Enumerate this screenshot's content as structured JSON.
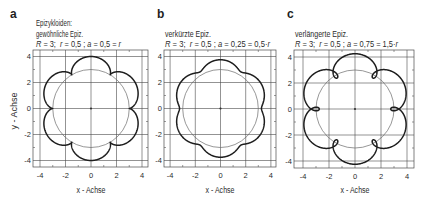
{
  "figure": {
    "y_axis_label": "y - Achse",
    "panels": [
      {
        "label": "a",
        "title_lines": [
          "Epizykloiden:",
          "gewöhnliche Epiz."
        ],
        "params_line": [
          "R",
          " = 3;  ",
          "r",
          " = 0,5 ; ",
          "a",
          " = 0,5 = ",
          "r"
        ],
        "x_axis_label": "x - Achse"
      },
      {
        "label": "b",
        "title_lines": [
          "verkürzte Epiz."
        ],
        "params_line": [
          "R",
          " = 3;  ",
          "r",
          " = 0,5 ; ",
          "a",
          " = 0,25 = 0,5·",
          "r"
        ],
        "x_axis_label": "x - Achse"
      },
      {
        "label": "c",
        "title_lines": [
          "verlängerte Epiz."
        ],
        "params_line": [
          "R",
          " = 3;  ",
          "r",
          " = 0,5 ; ",
          "a",
          " = 0,75 = 1,5·",
          "r"
        ],
        "x_axis_label": "x - Achse"
      }
    ]
  },
  "chart_data": [
    {
      "type": "line",
      "panel": "a",
      "title": "Epizykloiden: gewöhnliche Epiz.",
      "subtitle": "R = 3; r = 0,5 ; a = 0,5 = r",
      "params": {
        "R": 3,
        "r": 0.5,
        "a": 0.5
      },
      "xlabel": "x - Achse",
      "ylabel": "y - Achse",
      "xlim": [
        -4.5,
        4.5
      ],
      "ylim": [
        -4.5,
        4.5
      ],
      "x_ticks": [
        -4,
        -2,
        0,
        2,
        4
      ],
      "y_ticks": [
        -4,
        -2,
        0,
        2,
        4
      ],
      "x_tick_labels": [
        "-4",
        "-2",
        "0",
        "2",
        "4"
      ],
      "y_tick_labels": [
        "-4",
        "-2",
        "0",
        "2",
        "4"
      ],
      "grid": true,
      "legend": null,
      "circle": {
        "center": [
          0,
          0
        ],
        "radius": 3
      },
      "curve": {
        "lobes": 6,
        "max_radius": 4,
        "min_radius": 3,
        "feature": "cusps",
        "peak_points": [
          [
            3.46,
            2
          ],
          [
            0,
            4
          ],
          [
            -3.46,
            2
          ],
          [
            -3.46,
            -2
          ],
          [
            0,
            -4
          ],
          [
            3.46,
            -2
          ]
        ],
        "inner_points": [
          [
            3,
            0
          ],
          [
            1.5,
            2.6
          ],
          [
            -1.5,
            2.6
          ],
          [
            -3,
            0
          ],
          [
            -1.5,
            -2.6
          ],
          [
            1.5,
            -2.6
          ]
        ]
      }
    },
    {
      "type": "line",
      "panel": "b",
      "title": "verkürzte Epiz.",
      "subtitle": "R = 3; r = 0,5 ; a = 0,25 = 0,5·r",
      "params": {
        "R": 3,
        "r": 0.5,
        "a": 0.25
      },
      "xlabel": "x - Achse",
      "ylabel": "",
      "xlim": [
        -4.5,
        4.5
      ],
      "ylim": [
        -4.5,
        4.5
      ],
      "x_ticks": [
        -4,
        -2,
        0,
        2,
        4
      ],
      "y_ticks": [
        -4,
        -2,
        0,
        2,
        4
      ],
      "x_tick_labels": [
        "-4",
        "-2",
        "0",
        "2",
        "4"
      ],
      "y_tick_labels": [
        "-4",
        "-2",
        "0",
        "2",
        "4"
      ],
      "grid": true,
      "legend": null,
      "circle": {
        "center": [
          0,
          0
        ],
        "radius": 3
      },
      "curve": {
        "lobes": 6,
        "max_radius": 3.75,
        "min_radius": 3.25,
        "feature": "smooth waves",
        "peak_points": [
          [
            3.25,
            1.88
          ],
          [
            0,
            3.75
          ],
          [
            -3.25,
            1.88
          ],
          [
            -3.25,
            -1.88
          ],
          [
            0,
            -3.75
          ],
          [
            3.25,
            -1.88
          ]
        ],
        "inner_points": [
          [
            3.25,
            0
          ],
          [
            1.63,
            2.81
          ],
          [
            -1.63,
            2.81
          ],
          [
            -3.25,
            0
          ],
          [
            -1.63,
            -2.81
          ],
          [
            1.63,
            -2.81
          ]
        ]
      }
    },
    {
      "type": "line",
      "panel": "c",
      "title": "verlängerte Epiz.",
      "subtitle": "R = 3; r = 0,5 ; a = 0,75 = 1,5·r",
      "params": {
        "R": 3,
        "r": 0.5,
        "a": 0.75
      },
      "xlabel": "x - Achse",
      "ylabel": "",
      "xlim": [
        -4.5,
        4.5
      ],
      "ylim": [
        -4.5,
        4.5
      ],
      "x_ticks": [
        -4,
        -2,
        0,
        2,
        4
      ],
      "y_ticks": [
        -4,
        -2,
        0,
        2,
        4
      ],
      "x_tick_labels": [
        "-4",
        "-2",
        "0",
        "2",
        "4"
      ],
      "y_tick_labels": [
        "-4",
        "-2",
        "0",
        "2",
        "4"
      ],
      "grid": true,
      "legend": null,
      "circle": {
        "center": [
          0,
          0
        ],
        "radius": 3
      },
      "curve": {
        "lobes": 6,
        "max_radius": 4.25,
        "min_radius": 2.75,
        "feature": "loops",
        "peak_points": [
          [
            3.68,
            2.13
          ],
          [
            0,
            4.25
          ],
          [
            -3.68,
            2.13
          ],
          [
            -3.68,
            -2.13
          ],
          [
            0,
            -4.25
          ],
          [
            3.68,
            -2.13
          ]
        ],
        "inner_points": [
          [
            2.75,
            0
          ],
          [
            1.38,
            2.38
          ],
          [
            -1.38,
            2.38
          ],
          [
            -2.75,
            0
          ],
          [
            -1.38,
            -2.38
          ],
          [
            1.38,
            -2.38
          ]
        ]
      }
    }
  ]
}
